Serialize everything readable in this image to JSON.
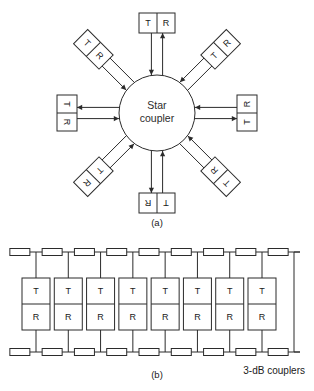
{
  "figure": {
    "line_color": "#2b2b2b",
    "fill_color": "#ffffff",
    "background": "#ffffff"
  },
  "panel_a": {
    "label": "(a)",
    "topology": "star",
    "hub": {
      "name": "star-coupler",
      "label_line1": "Star",
      "label_line2": "coupler",
      "center_x": 157,
      "center_y": 113,
      "radius": 38
    },
    "node_count": 8,
    "nodes": [
      {
        "id": "node-n",
        "position": "north",
        "angle_deg": 270,
        "rotation_deg": 0,
        "transmit_label": "T",
        "receive_label": "R"
      },
      {
        "id": "node-ne",
        "position": "north-east",
        "angle_deg": 315,
        "rotation_deg": -45,
        "transmit_label": "T",
        "receive_label": "R"
      },
      {
        "id": "node-e",
        "position": "east",
        "angle_deg": 0,
        "rotation_deg": -90,
        "transmit_label": "T",
        "receive_label": "R"
      },
      {
        "id": "node-se",
        "position": "south-east",
        "angle_deg": 45,
        "rotation_deg": -135,
        "transmit_label": "T",
        "receive_label": "R"
      },
      {
        "id": "node-s",
        "position": "south",
        "angle_deg": 90,
        "rotation_deg": 180,
        "transmit_label": "T",
        "receive_label": "R"
      },
      {
        "id": "node-sw",
        "position": "south-west",
        "angle_deg": 135,
        "rotation_deg": 135,
        "transmit_label": "T",
        "receive_label": "R"
      },
      {
        "id": "node-w",
        "position": "west",
        "angle_deg": 180,
        "rotation_deg": 90,
        "transmit_label": "T",
        "receive_label": "R"
      },
      {
        "id": "node-nw",
        "position": "north-west",
        "angle_deg": 225,
        "rotation_deg": 45,
        "transmit_label": "T",
        "receive_label": "R"
      }
    ]
  },
  "panel_b": {
    "label": "(b)",
    "topology": "bus",
    "caption": "3-dB couplers",
    "station_count": 8,
    "stations": [
      {
        "id": "station-1",
        "transmit_label": "T",
        "receive_label": "R"
      },
      {
        "id": "station-2",
        "transmit_label": "T",
        "receive_label": "R"
      },
      {
        "id": "station-3",
        "transmit_label": "T",
        "receive_label": "R"
      },
      {
        "id": "station-4",
        "transmit_label": "T",
        "receive_label": "R"
      },
      {
        "id": "station-5",
        "transmit_label": "T",
        "receive_label": "R"
      },
      {
        "id": "station-6",
        "transmit_label": "T",
        "receive_label": "R"
      },
      {
        "id": "station-7",
        "transmit_label": "T",
        "receive_label": "R"
      },
      {
        "id": "station-8",
        "transmit_label": "T",
        "receive_label": "R"
      }
    ],
    "coupler_count_top": 9,
    "coupler_count_bottom": 9
  }
}
